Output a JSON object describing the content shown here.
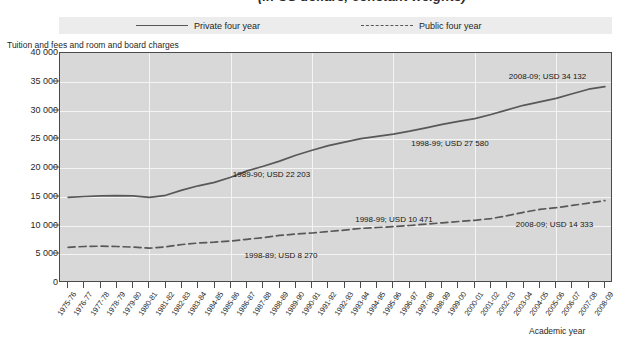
{
  "title": {
    "clipped_text": "(in US dollars, constant weights)"
  },
  "legend": {
    "position": "top",
    "items": [
      {
        "label": "Private four year",
        "style": "solid",
        "icon": "line-solid-icon",
        "color": "#585858"
      },
      {
        "label": "Public four year",
        "style": "dashed",
        "icon": "line-dashed-icon",
        "color": "#585858"
      }
    ]
  },
  "axes": {
    "y_caption": "Tuition and fees and room and board charges",
    "x_caption": "Academic year"
  },
  "chart_data": {
    "type": "line",
    "title": "",
    "xlabel": "Academic year",
    "ylabel": "Tuition and fees and room and board charges",
    "ylim": [
      0,
      40000
    ],
    "yticks": [
      0,
      5000,
      10000,
      15000,
      20000,
      25000,
      30000,
      35000,
      40000
    ],
    "ytick_labels": [
      "0",
      "5 000",
      "10 000",
      "15 000",
      "20 000",
      "25 000",
      "30 000",
      "35 000",
      "40 000"
    ],
    "grid": true,
    "legend_position": "top",
    "categories": [
      "1975-76",
      "1976-77",
      "1977-78",
      "1978-79",
      "1979-80",
      "1980-81",
      "1981-82",
      "1982-83",
      "1983-84",
      "1984-85",
      "1985-86",
      "1986-87",
      "1987-88",
      "1988-89",
      "1989-90",
      "1990-91",
      "1991-92",
      "1992-93",
      "1993-94",
      "1994-95",
      "1995-96",
      "1996-97",
      "1997-98",
      "1998-99",
      "1999-00",
      "2000-01",
      "2001-02",
      "2002-03",
      "2003-04",
      "2004-05",
      "2005-06",
      "2006-07",
      "2007-08",
      "2008-09"
    ],
    "series": [
      {
        "name": "Private four year",
        "style": "solid",
        "values": [
          14900,
          15050,
          15150,
          15200,
          15150,
          14900,
          15250,
          16150,
          16900,
          17500,
          18400,
          19500,
          20300,
          21200,
          22203,
          23100,
          23900,
          24500,
          25100,
          25500,
          25900,
          26400,
          27000,
          27580,
          28100,
          28600,
          29300,
          30100,
          30900,
          31500,
          32100,
          32900,
          33700,
          34132
        ]
      },
      {
        "name": "Public four year",
        "style": "dashed",
        "values": [
          6200,
          6350,
          6400,
          6350,
          6250,
          6050,
          6300,
          6700,
          6950,
          7100,
          7300,
          7600,
          7900,
          8270,
          8500,
          8700,
          8950,
          9200,
          9500,
          9650,
          9800,
          10000,
          10250,
          10471,
          10700,
          10900,
          11200,
          11700,
          12300,
          12800,
          13100,
          13500,
          13900,
          14333
        ]
      }
    ],
    "annotations": [
      {
        "text": "1989-90; USD 22 203",
        "series": "Private four year",
        "category": "1989-90",
        "value": 22203
      },
      {
        "text": "1998-99; USD 27 580",
        "series": "Private four year",
        "category": "1998-99",
        "value": 27580
      },
      {
        "text": "2008-09; USD 34 132",
        "series": "Private four year",
        "category": "2008-09",
        "value": 34132
      },
      {
        "text": "1998-89; USD 8 270",
        "series": "Public four year",
        "category": "1988-89",
        "value": 8270
      },
      {
        "text": "1998-99; USD 10 471",
        "series": "Public four year",
        "category": "1998-99",
        "value": 10471
      },
      {
        "text": "2008-09; USD 14 333",
        "series": "Public four year",
        "category": "2008-09",
        "value": 14333
      }
    ]
  }
}
